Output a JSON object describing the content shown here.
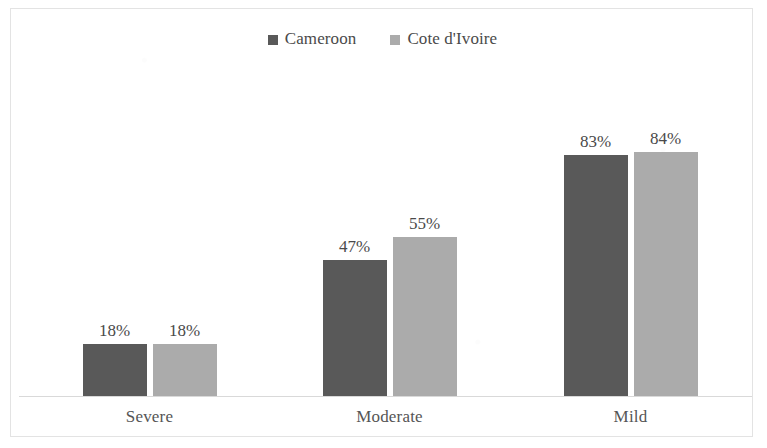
{
  "chart_data": {
    "type": "bar",
    "title": "",
    "subtitle": "",
    "xlabel": "",
    "ylabel": "",
    "grid": false,
    "legend_position": "top-center",
    "axis_visible": {
      "x": true,
      "y": false
    },
    "value_label_suffix": "%",
    "ylim": [
      0,
      100
    ],
    "categories": [
      "Severe",
      "Moderate",
      "Mild"
    ],
    "series": [
      {
        "name": "Cameroon",
        "color": "#595959",
        "values": [
          18,
          47,
          83
        ],
        "labels": [
          "18%",
          "47%",
          "83%"
        ]
      },
      {
        "name": "Cote d'Ivoire",
        "color": "#ABABAB",
        "values": [
          18,
          55,
          84
        ],
        "labels": [
          "18%",
          "55%",
          "84%"
        ]
      }
    ]
  },
  "legend": {
    "entries": [
      {
        "label": "Cameroon",
        "marker": "square-swatch-dark"
      },
      {
        "label": "Cote d'Ivoire",
        "marker": "square-swatch-light"
      }
    ]
  },
  "colors": {
    "series_dark": "#595959",
    "series_light": "#ABABAB",
    "axis_line": "#d9d9d9",
    "frame_border": "#e3e3e3",
    "label_text": "#4a4a4a",
    "category_text": "#555555",
    "background": "#ffffff"
  }
}
